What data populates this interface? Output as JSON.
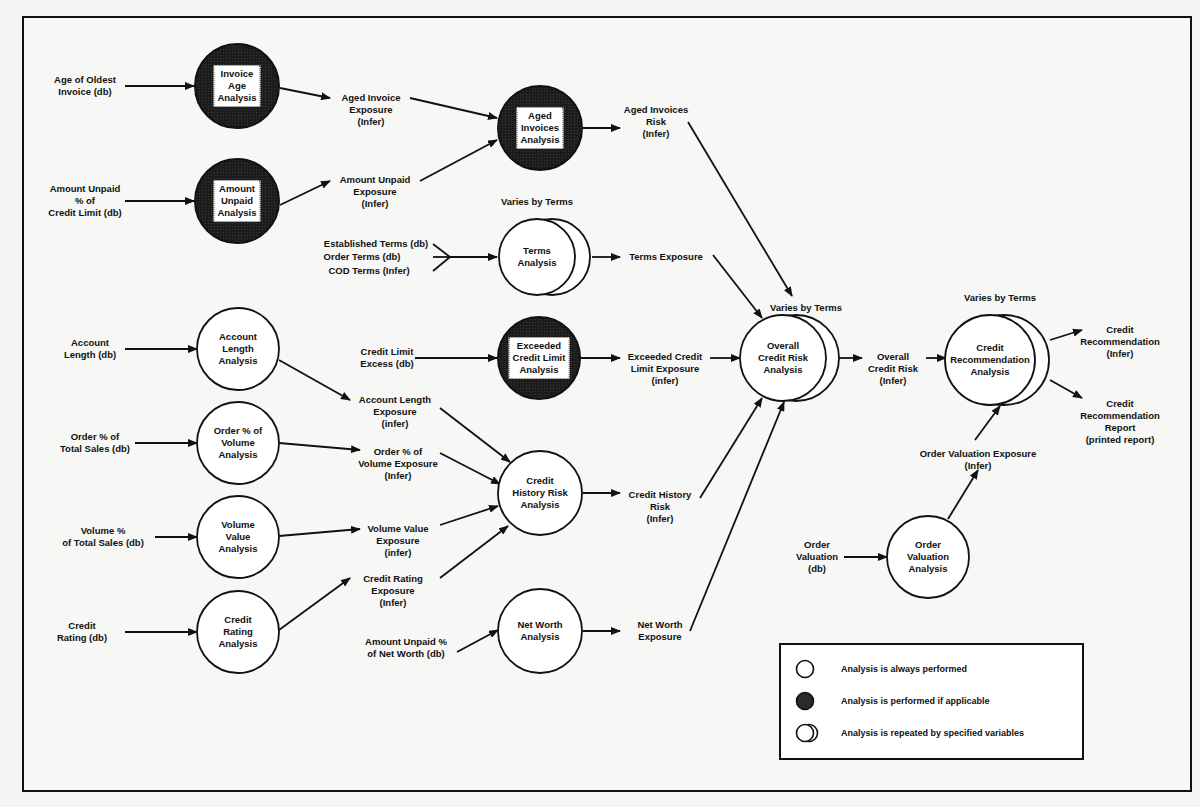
{
  "diagram": {
    "inputs": {
      "age_oldest_invoice": "Age of Oldest\nInvoice (db)",
      "amount_unpaid_pct_limit": "Amount Unpaid\n% of\nCredit Limit (db)",
      "account_length": "Account\nLength (db)",
      "order_pct_total_sales": "Order % of\nTotal Sales (db)",
      "volume_pct_total_sales": "Volume %\nof Total Sales (db)",
      "credit_rating": "Credit\nRating (db)",
      "established_terms": "Established Terms (db)",
      "order_terms": "Order Terms (db)",
      "cod_terms": "COD Terms (Infer)",
      "credit_limit_excess": "Credit Limit\nExcess (db)",
      "amount_unpaid_pct_net_worth": "Amount Unpaid %\nof Net Worth (db)",
      "order_valuation": "Order\nValuation\n(db)"
    },
    "nodes": {
      "invoice_age": {
        "label": "Invoice\nAge\nAnalysis",
        "type": "conditional"
      },
      "amount_unpaid": {
        "label": "Amount\nUnpaid\nAnalysis",
        "type": "conditional"
      },
      "account_length": {
        "label": "Account\nLength\nAnalysis",
        "type": "always"
      },
      "order_volume": {
        "label": "Order % of\nVolume\nAnalysis",
        "type": "always"
      },
      "volume_value": {
        "label": "Volume\nValue\nAnalysis",
        "type": "always"
      },
      "credit_rating": {
        "label": "Credit\nRating\nAnalysis",
        "type": "always"
      },
      "aged_invoices": {
        "label": "Aged\nInvoices\nAnalysis",
        "type": "conditional"
      },
      "terms": {
        "label": "Terms\nAnalysis",
        "type": "repeated",
        "note": "Varies by Terms"
      },
      "exceeded_limit": {
        "label": "Exceeded\nCredit Limit\nAnalysis",
        "type": "conditional"
      },
      "credit_history": {
        "label": "Credit\nHistory Risk\nAnalysis",
        "type": "always"
      },
      "net_worth": {
        "label": "Net Worth\nAnalysis",
        "type": "always"
      },
      "overall_credit_risk": {
        "label": "Overall\nCredit Risk\nAnalysis",
        "type": "repeated",
        "note": "Varies by Terms"
      },
      "order_valuation": {
        "label": "Order\nValuation\nAnalysis",
        "type": "always"
      },
      "credit_recommendation": {
        "label": "Credit\nRecommendation\nAnalysis",
        "type": "repeated",
        "note": "Varies by Terms"
      }
    },
    "outputs": {
      "aged_invoice_exposure": "Aged Invoice\nExposure\n(Infer)",
      "amount_unpaid_exposure": "Amount Unpaid\nExposure\n(Infer)",
      "account_length_exposure": "Account Length\nExposure\n(infer)",
      "order_volume_exposure": "Order % of\nVolume Exposure\n(Infer)",
      "volume_value_exposure": "Volume Value\nExposure\n(infer)",
      "credit_rating_exposure": "Credit Rating\nExposure\n(Infer)",
      "aged_invoices_risk": "Aged Invoices\nRisk\n(Infer)",
      "terms_exposure": "Terms Exposure",
      "exceeded_limit_exposure": "Exceeded Credit\nLimit Exposure\n(infer)",
      "credit_history_risk": "Credit History\nRisk\n(Infer)",
      "net_worth_exposure": "Net Worth\nExposure",
      "overall_credit_risk": "Overall\nCredit Risk\n(Infer)",
      "order_valuation_exposure": "Order Valuation Exposure\n(Infer)",
      "credit_recommendation": "Credit\nRecommendation\n(Infer)",
      "credit_recommendation_report": "Credit\nRecommendation\nReport\n(printed report)"
    }
  },
  "legend": {
    "always": "Analysis is always performed",
    "conditional": "Analysis is performed if applicable",
    "repeated": "Analysis is repeated by specified variables"
  },
  "colors": {
    "stroke": "#111111",
    "conditional_fill": "#1c1c1c",
    "background": "#f7f7f5"
  }
}
